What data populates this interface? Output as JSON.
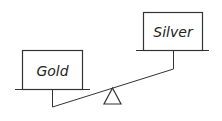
{
  "diagram": {
    "type": "balance-scale",
    "left_pan": {
      "label": "Gold",
      "position": "lower"
    },
    "right_pan": {
      "label": "Silver",
      "position": "higher"
    },
    "fulcrum": "triangle"
  },
  "colors": {
    "stroke": "#333333",
    "background": "#ffffff"
  }
}
